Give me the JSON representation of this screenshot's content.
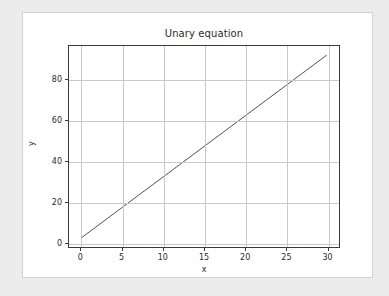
{
  "chart_data": {
    "type": "line",
    "title": "Unary equation",
    "xlabel": "x",
    "ylabel": "y",
    "xlim": [
      -1.5,
      31.5
    ],
    "ylim": [
      -2.5,
      96.5
    ],
    "xticks": [
      0,
      5,
      10,
      15,
      20,
      25,
      30
    ],
    "xticklabels": [
      "0",
      "5",
      "10",
      "15",
      "20",
      "25",
      "30"
    ],
    "yticks": [
      0,
      20,
      40,
      60,
      80
    ],
    "yticklabels": [
      "0",
      "20",
      "40",
      "60",
      "80"
    ],
    "grid": true,
    "legend": null,
    "series": [
      {
        "name": "y = 3x + 2",
        "color": "#4f4f4f",
        "linewidth": 1,
        "x": [
          0,
          5,
          10,
          15,
          20,
          25,
          30
        ],
        "y": [
          2,
          17,
          32,
          47,
          62,
          77,
          92
        ]
      }
    ]
  },
  "figure": {
    "background": "#ececed",
    "canvas_background": "#ffffff",
    "axes_edge_color": "#3b3b3b",
    "grid_color": "#c9c9cb",
    "text_color": "#2b2b2b"
  }
}
